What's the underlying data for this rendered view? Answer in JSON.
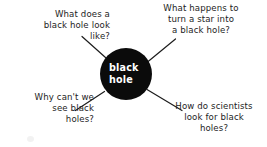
{
  "diagram": {
    "type": "concept-map",
    "title_node": {
      "line1": "black",
      "line2": "hole",
      "fill_color": "#0b0b0b",
      "text_color": "#ffffff"
    },
    "background_color": "#ffffff",
    "line_color": "#1d1d1d",
    "branches": [
      {
        "id": "look-like",
        "position": "top-left",
        "text": "What does a\nblack hole look\nlike?"
      },
      {
        "id": "star-into",
        "position": "top-right",
        "text": "What happens to\nturn a star into\na black hole?"
      },
      {
        "id": "cant-see",
        "position": "bottom-left",
        "text": "Why can't we\nsee black\nholes?"
      },
      {
        "id": "scientists",
        "position": "bottom-right",
        "text": "How do scientists\nlook for black\nholes?"
      }
    ]
  }
}
